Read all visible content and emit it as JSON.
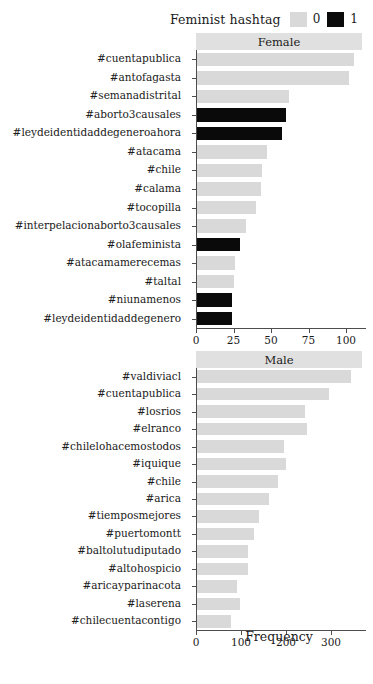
{
  "figure": {
    "cut_off_top_text": "",
    "legend": {
      "title": "Feminist hashtag",
      "keys": [
        {
          "label": "0",
          "color": "#d9d9d9"
        },
        {
          "label": "1",
          "color": "#0a0a0a"
        }
      ]
    },
    "xaxis_title": "Frequency"
  },
  "chart_data": [
    {
      "type": "bar",
      "title": "Female",
      "orientation": "horizontal",
      "xlabel": "Frequency",
      "ylabel": "",
      "xlim": [
        0,
        108
      ],
      "xticks": [
        0,
        25,
        50,
        75,
        100
      ],
      "grid": false,
      "legend_position": "top-right",
      "legend_title": "Feminist hashtag",
      "categories": [
        "#cuentapublica",
        "#antofagasta",
        "#semanadistrital",
        "#aborto3causales",
        "#leydeidentidaddegeneroahora",
        "#atacama",
        "#chile",
        "#calama",
        "#tocopilla",
        "#interpelacionaborto3causales",
        "#olafeminista",
        "#atacamamerecemas",
        "#taltal",
        "#niunamenos",
        "#leydeidentidaddegenero"
      ],
      "values": [
        105,
        102,
        62,
        60,
        57,
        47,
        44,
        43,
        40,
        33,
        29,
        26,
        25,
        24,
        24
      ],
      "groups": [
        0,
        0,
        0,
        1,
        1,
        0,
        0,
        0,
        0,
        0,
        1,
        1,
        0,
        0,
        1,
        1
      ],
      "feminist_hashtag": [
        0,
        0,
        0,
        1,
        1,
        0,
        0,
        0,
        0,
        0,
        1,
        0,
        0,
        1,
        1
      ]
    },
    {
      "type": "bar",
      "title": "Male",
      "orientation": "horizontal",
      "xlabel": "Frequency",
      "ylabel": "",
      "xlim": [
        0,
        360
      ],
      "xticks": [
        0,
        100,
        200,
        300
      ],
      "grid": false,
      "legend_position": "top-right",
      "legend_title": "Feminist hashtag",
      "categories": [
        "#valdiviacl",
        "#cuentapublica",
        "#losrios",
        "#elranco",
        "#chilelohacemostodos",
        "#iquique",
        "#chile",
        "#arica",
        "#tiemposmejores",
        "#puertomontt",
        "#baltolutudiputado",
        "#altohospicio",
        "#aricayparinacota",
        "#laserena",
        "#chilecuentacontigo"
      ],
      "values": [
        345,
        295,
        243,
        247,
        195,
        200,
        183,
        163,
        140,
        128,
        115,
        115,
        90,
        97,
        78
      ],
      "feminist_hashtag": [
        0,
        0,
        0,
        0,
        0,
        0,
        0,
        0,
        0,
        0,
        0,
        0,
        0,
        0,
        0
      ]
    }
  ]
}
